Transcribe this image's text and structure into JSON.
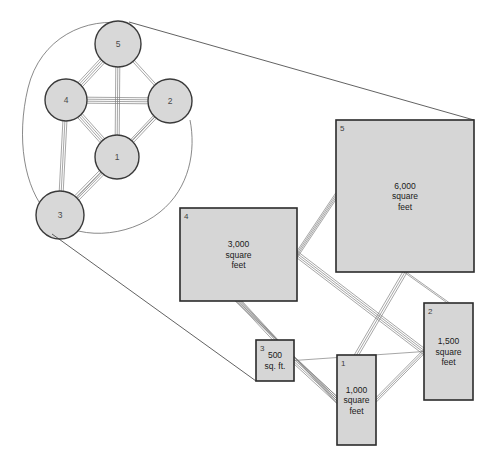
{
  "figure": {
    "title_strip": "",
    "colors": {
      "node_fill": "#d8d8d8",
      "node_stroke": "#3a3a3a",
      "box_fill": "#d6d6d6",
      "box_stroke": "#2b2b2b",
      "edge_stroke": "#808080",
      "outline_stroke": "#6b6b6b",
      "connector_stroke": "#3a3a3a",
      "background": "#ffffff",
      "text": "#1a1a1a"
    },
    "graph_view": {
      "name": "node-link-graph",
      "enclosure_label": "",
      "nodes": [
        {
          "id": "1",
          "label": "1",
          "cx": 117,
          "cy": 157,
          "r": 22
        },
        {
          "id": "2",
          "label": "2",
          "cx": 170,
          "cy": 101,
          "r": 22
        },
        {
          "id": "3",
          "label": "3",
          "cx": 60,
          "cy": 215,
          "r": 24
        },
        {
          "id": "4",
          "label": "4",
          "cx": 66,
          "cy": 100,
          "r": 21
        },
        {
          "id": "5",
          "label": "5",
          "cx": 118,
          "cy": 44,
          "r": 23
        }
      ],
      "edges": [
        {
          "from": "5",
          "to": "4",
          "strands": 4
        },
        {
          "from": "5",
          "to": "2",
          "strands": 2
        },
        {
          "from": "5",
          "to": "1",
          "strands": 3
        },
        {
          "from": "4",
          "to": "2",
          "strands": 4
        },
        {
          "from": "4",
          "to": "1",
          "strands": 4
        },
        {
          "from": "4",
          "to": "3",
          "strands": 3
        },
        {
          "from": "2",
          "to": "1",
          "strands": 3
        },
        {
          "from": "1",
          "to": "3",
          "strands": 4
        },
        {
          "from": "2",
          "to": "3",
          "strands": 1
        }
      ]
    },
    "area_view": {
      "name": "area-proportional-diagram",
      "boxes": [
        {
          "id": "5",
          "id_label": "5",
          "lines": [
            "6,000",
            "square",
            "feet"
          ],
          "x": 336,
          "y": 120,
          "w": 138,
          "h": 152
        },
        {
          "id": "4",
          "id_label": "4",
          "lines": [
            "3,000",
            "square",
            "feet"
          ],
          "x": 180,
          "y": 208,
          "w": 117,
          "h": 93
        },
        {
          "id": "2",
          "id_label": "2",
          "lines": [
            "1,500",
            "square",
            "feet"
          ],
          "x": 424,
          "y": 303,
          "w": 49,
          "h": 97
        },
        {
          "id": "1",
          "id_label": "1",
          "lines": [
            "1,000",
            "square",
            "feet"
          ],
          "x": 337,
          "y": 355,
          "w": 39,
          "h": 90
        },
        {
          "id": "3",
          "id_label": "3",
          "lines": [
            "500",
            "sq. ft."
          ],
          "x": 256,
          "y": 340,
          "w": 38,
          "h": 41
        }
      ],
      "connectors": [
        {
          "name": "callout-top",
          "x1": 129,
          "y1": 22,
          "x2": 474,
          "y2": 120
        },
        {
          "name": "callout-bottom",
          "x1": 52,
          "y1": 234,
          "x2": 256,
          "y2": 381
        }
      ]
    }
  }
}
